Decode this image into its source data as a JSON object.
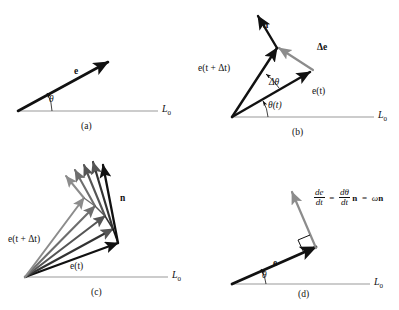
{
  "figure": {
    "background_color": "#ffffff",
    "ink_color": "#111111",
    "grey_color": "#8c8c8c",
    "axis_color": "#9a9a9a"
  },
  "panels": [
    {
      "id": "a",
      "caption": "(a)",
      "axis_label": "L",
      "axis_subscript": "0",
      "labels": {
        "vector_e": "e",
        "angle_theta": "θ"
      }
    },
    {
      "id": "b",
      "caption": "(b)",
      "axis_label": "L",
      "axis_subscript": "0",
      "labels": {
        "normal_n": "n",
        "delta_e": "Δe",
        "e_t_plus_dt": "e(t + Δt)",
        "e_t": "e(t)",
        "delta_theta": "Δθ",
        "theta_t": "θ(t)"
      }
    },
    {
      "id": "c",
      "caption": "(c)",
      "axis_label": "L",
      "axis_subscript": "0",
      "labels": {
        "normal_n": "n",
        "e_t_plus_dt": "e(t + Δt)",
        "e_t": "e(t)"
      }
    },
    {
      "id": "d",
      "caption": "(d)",
      "axis_label": "L",
      "axis_subscript": "0",
      "labels": {
        "vector_e": "e",
        "angle_theta": "θ"
      },
      "equation": {
        "full_text": "de/dt = dθ/dt n = ωn",
        "lhs_numerator": "de",
        "lhs_denominator": "dt",
        "equals_1": "=",
        "rhs_numerator": "dθ",
        "rhs_denominator": "dt",
        "rhs_vector": "n",
        "equals_2": "=",
        "omega": "ω",
        "omega_vector": "n"
      }
    }
  ]
}
